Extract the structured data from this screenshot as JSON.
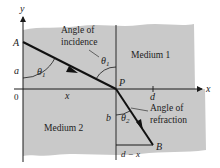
{
  "diagram": {
    "axes": {
      "x_label": "x",
      "y_label": "y",
      "origin_label": "0"
    },
    "points": {
      "A": "A",
      "P": "P",
      "B": "B"
    },
    "regions": {
      "top": "Medium 1",
      "bottom": "Medium 2"
    },
    "angles": {
      "incidence_line1": "Angle of",
      "incidence_line2": "incidence",
      "refraction_line1": "Angle of",
      "refraction_line2": "refraction",
      "theta1": "θ",
      "theta1_sub": "1",
      "theta2": "θ",
      "theta2_sub": "2"
    },
    "lengths": {
      "a": "a",
      "b": "b",
      "x": "x",
      "d": "d",
      "d_minus_x": "d − x"
    },
    "colors": {
      "medium_fill": "#c9c9c9",
      "line": "#1a1a1a",
      "ray": "#111111"
    }
  }
}
